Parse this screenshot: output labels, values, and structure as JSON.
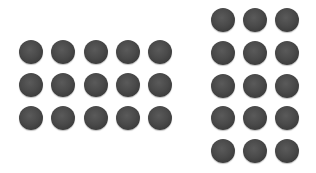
{
  "groups": [
    {
      "name": "left-array",
      "rows": 3,
      "columns": 5,
      "count": 15,
      "origin": {
        "x": 19,
        "y": 40
      },
      "spacing": {
        "x": 32.3,
        "y": 33
      }
    },
    {
      "name": "right-array",
      "rows": 5,
      "columns": 3,
      "count": 15,
      "origin": {
        "x": 211,
        "y": 8
      },
      "spacing": {
        "x": 32,
        "y": 32.8
      }
    }
  ],
  "dot": {
    "shape": "circle",
    "diameter": 24,
    "color": "#444444"
  }
}
